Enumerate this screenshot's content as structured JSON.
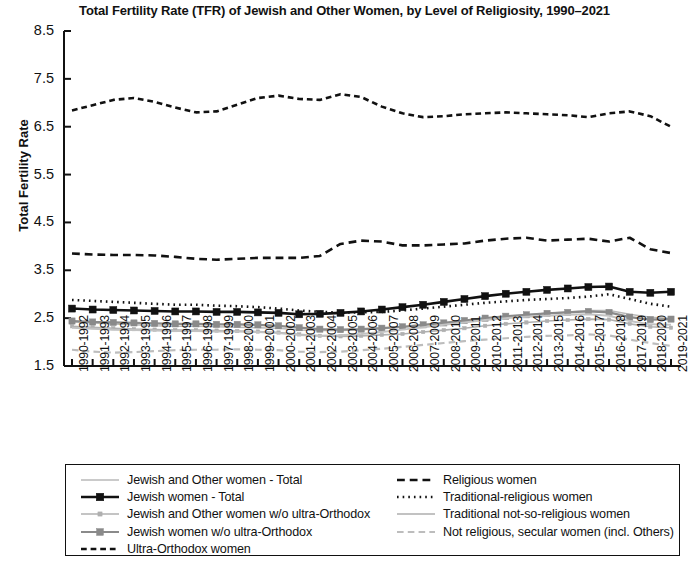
{
  "chart_data": {
    "type": "line",
    "title": "Total Fertility Rate (TFR) of Jewish and Other Women, by Level of Religiosity, 1990–2021",
    "xlabel": "",
    "ylabel": "Total Fertility Rate",
    "ylim": [
      1.5,
      8.5
    ],
    "yticks": [
      "8.5",
      "7.5",
      "6.5",
      "5.5",
      "4.5",
      "3.5",
      "2.5",
      "1.5"
    ],
    "ytick_values": [
      8.5,
      7.5,
      6.5,
      5.5,
      4.5,
      3.5,
      2.5,
      1.5
    ],
    "grid": false,
    "legend_position": "below",
    "categories": [
      "1990-1992",
      "1991-1993",
      "1992-1994",
      "1993-1995",
      "1994-1996",
      "1995-1997",
      "1996-1998",
      "1997-1999",
      "1998-2000",
      "1999-2001",
      "2000-2002",
      "2001-2003",
      "2002-2004",
      "2003-2005",
      "2004-2006",
      "2005-2007",
      "2006-2008",
      "2007-2009",
      "2008-2010",
      "2009-2011",
      "2010-2012",
      "2011-2013",
      "2012-2014",
      "2013-2015",
      "2014-2016",
      "2015-2017",
      "2016-2018",
      "2017-2019",
      "2018-2020",
      "2019-2021"
    ],
    "series": [
      {
        "name": "Jewish and Other women - Total",
        "style": "solid",
        "color": "#b9b9b9",
        "width": 1.5,
        "marker": "none",
        "values": [
          2.42,
          2.4,
          2.38,
          2.36,
          2.34,
          2.33,
          2.33,
          2.32,
          2.31,
          2.3,
          2.29,
          2.25,
          2.24,
          2.24,
          2.26,
          2.28,
          2.31,
          2.35,
          2.39,
          2.43,
          2.48,
          2.53,
          2.57,
          2.6,
          2.63,
          2.66,
          2.66,
          2.58,
          2.52,
          2.49
        ]
      },
      {
        "name": "Jewish women - Total",
        "style": "solid",
        "color": "#111111",
        "width": 2.6,
        "marker": "square",
        "values": [
          2.7,
          2.68,
          2.67,
          2.66,
          2.65,
          2.64,
          2.64,
          2.63,
          2.63,
          2.62,
          2.61,
          2.58,
          2.59,
          2.61,
          2.64,
          2.68,
          2.73,
          2.78,
          2.84,
          2.9,
          2.96,
          3.01,
          3.05,
          3.09,
          3.12,
          3.15,
          3.16,
          3.05,
          3.03,
          3.05
        ]
      },
      {
        "name": "Jewish and Other women w/o ultra-Orthodox",
        "style": "solid",
        "color": "#b0b0b0",
        "width": 1.6,
        "marker": "small-square",
        "values": [
          2.33,
          2.31,
          2.29,
          2.27,
          2.26,
          2.25,
          2.25,
          2.24,
          2.23,
          2.22,
          2.2,
          2.16,
          2.13,
          2.12,
          2.13,
          2.15,
          2.17,
          2.21,
          2.25,
          2.29,
          2.34,
          2.38,
          2.41,
          2.44,
          2.46,
          2.48,
          2.47,
          2.38,
          2.32,
          2.3
        ]
      },
      {
        "name": "Jewish women w/o ultra-Orthodox",
        "style": "solid",
        "color": "#8a8a8a",
        "width": 2.2,
        "marker": "square",
        "values": [
          2.44,
          2.42,
          2.41,
          2.4,
          2.39,
          2.38,
          2.38,
          2.37,
          2.37,
          2.36,
          2.34,
          2.3,
          2.27,
          2.26,
          2.27,
          2.29,
          2.32,
          2.36,
          2.4,
          2.45,
          2.5,
          2.54,
          2.57,
          2.6,
          2.62,
          2.64,
          2.62,
          2.52,
          2.47,
          2.48
        ]
      },
      {
        "name": "Ultra-Orthodox women",
        "style": "dotted-dash",
        "color": "#111111",
        "width": 2.6,
        "marker": "none",
        "values": [
          6.84,
          6.95,
          7.06,
          7.1,
          7.02,
          6.9,
          6.8,
          6.82,
          6.96,
          7.1,
          7.15,
          7.08,
          7.06,
          7.18,
          7.12,
          6.92,
          6.78,
          6.7,
          6.72,
          6.76,
          6.78,
          6.8,
          6.78,
          6.76,
          6.74,
          6.7,
          6.78,
          6.82,
          6.72,
          6.5
        ]
      },
      {
        "name": "Religious women",
        "style": "dashed",
        "color": "#111111",
        "width": 2.6,
        "marker": "none",
        "values": [
          3.85,
          3.83,
          3.82,
          3.82,
          3.81,
          3.78,
          3.74,
          3.72,
          3.74,
          3.76,
          3.76,
          3.76,
          3.8,
          4.05,
          4.12,
          4.1,
          4.02,
          4.02,
          4.04,
          4.06,
          4.12,
          4.16,
          4.18,
          4.12,
          4.14,
          4.16,
          4.1,
          4.18,
          3.94,
          3.86
        ]
      },
      {
        "name": "Traditional-religious women",
        "style": "dotted",
        "color": "#111111",
        "width": 2.6,
        "marker": "none",
        "values": [
          2.88,
          2.86,
          2.84,
          2.82,
          2.8,
          2.78,
          2.78,
          2.76,
          2.75,
          2.73,
          2.7,
          2.66,
          2.63,
          2.62,
          2.62,
          2.63,
          2.66,
          2.7,
          2.74,
          2.78,
          2.82,
          2.85,
          2.88,
          2.9,
          2.92,
          2.95,
          3.0,
          2.9,
          2.8,
          2.74
        ]
      },
      {
        "name": "Traditional not-so-religious women",
        "style": "solid",
        "color": "#c2c2c2",
        "width": 2.0,
        "marker": "none",
        "values": [
          2.3,
          2.28,
          2.26,
          2.25,
          2.24,
          2.23,
          2.23,
          2.22,
          2.22,
          2.21,
          2.19,
          2.15,
          2.13,
          2.14,
          2.17,
          2.21,
          2.26,
          2.31,
          2.36,
          2.41,
          2.46,
          2.5,
          2.53,
          2.55,
          2.57,
          2.58,
          2.55,
          2.44,
          2.37,
          2.36
        ]
      },
      {
        "name": "Not religious, secular women (incl. Others)",
        "style": "dashed",
        "color": "#bdbdbd",
        "width": 2.2,
        "marker": "none",
        "values": [
          1.84,
          1.8,
          1.78,
          1.79,
          1.81,
          1.83,
          1.84,
          1.84,
          1.85,
          1.84,
          1.83,
          1.8,
          1.79,
          1.8,
          1.83,
          1.86,
          1.9,
          1.94,
          1.98,
          2.02,
          2.05,
          2.08,
          2.11,
          2.13,
          2.14,
          2.16,
          2.14,
          2.05,
          1.98,
          1.92
        ]
      }
    ]
  },
  "legend": {
    "left_column": [
      {
        "label": "Jewish and Other women - Total",
        "series_index": 0
      },
      {
        "label": "Jewish women - Total",
        "series_index": 1
      },
      {
        "label": "Jewish and Other women w/o ultra-Orthodox",
        "series_index": 2
      },
      {
        "label": "Jewish women w/o ultra-Orthodox",
        "series_index": 3
      },
      {
        "label": "Ultra-Orthodox women",
        "series_index": 4
      }
    ],
    "right_column": [
      {
        "label": "Religious women",
        "series_index": 5
      },
      {
        "label": "Traditional-religious women",
        "series_index": 6
      },
      {
        "label": "Traditional not-so-religious women",
        "series_index": 7
      },
      {
        "label": "Not religious, secular women (incl. Others)",
        "series_index": 8
      }
    ]
  }
}
